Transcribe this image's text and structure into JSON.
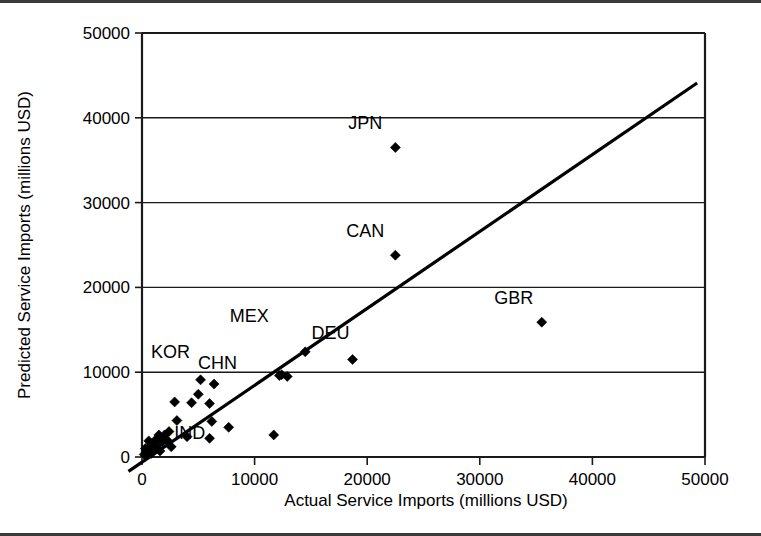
{
  "chart_data": {
    "type": "scatter",
    "title": "",
    "xlabel": "Actual Service Imports (millions USD)",
    "ylabel": "Predicted Service Imports (millions USD)",
    "xlim": [
      0,
      50000
    ],
    "ylim": [
      0,
      50000
    ],
    "xticks": [
      "0",
      "10000",
      "20000",
      "30000",
      "40000",
      "50000"
    ],
    "yticks": [
      "0",
      "10000",
      "20000",
      "30000",
      "40000",
      "50000"
    ],
    "xtick_values": [
      0,
      10000,
      20000,
      30000,
      40000,
      50000
    ],
    "ytick_values": [
      0,
      10000,
      20000,
      30000,
      40000,
      50000
    ],
    "grid": "horizontal",
    "legend": "none",
    "series": [
      {
        "name": "Countries",
        "marker": "diamond",
        "color": "#000000",
        "points": [
          {
            "label": "JPN",
            "x": 22500,
            "y": 36500,
            "label_dx": -30,
            "label_dy": -18
          },
          {
            "label": "CAN",
            "x": 22500,
            "y": 23800,
            "label_dx": -30,
            "label_dy": -18
          },
          {
            "label": "GBR",
            "x": 35500,
            "y": 15900,
            "label_dx": -28,
            "label_dy": -18
          },
          {
            "label": "MEX",
            "x": 14500,
            "y": 12400,
            "label_dx": -56,
            "label_dy": -30
          },
          {
            "label": "DEU",
            "x": 18700,
            "y": 11500,
            "label_dx": -22,
            "label_dy": -20
          },
          {
            "label": "CHN",
            "x": 12400,
            "y": 9700,
            "label_dx": -64,
            "label_dy": -6
          },
          {
            "label": "KOR",
            "x": 5200,
            "y": 9100,
            "label_dx": -30,
            "label_dy": -22
          },
          {
            "label": "IND",
            "x": 6200,
            "y": 4200,
            "label_dx": -22,
            "label_dy": 18
          },
          {
            "label": "",
            "x": 12200,
            "y": 9600,
            "label_dx": 0,
            "label_dy": 0
          },
          {
            "label": "",
            "x": 12900,
            "y": 9500,
            "label_dx": 0,
            "label_dy": 0
          },
          {
            "label": "",
            "x": 5000,
            "y": 7400,
            "label_dx": 0,
            "label_dy": 0
          },
          {
            "label": "",
            "x": 6400,
            "y": 8600,
            "label_dx": 0,
            "label_dy": 0
          },
          {
            "label": "",
            "x": 2900,
            "y": 6500,
            "label_dx": 0,
            "label_dy": 0
          },
          {
            "label": "",
            "x": 4400,
            "y": 6400,
            "label_dx": 0,
            "label_dy": 0
          },
          {
            "label": "",
            "x": 6000,
            "y": 6300,
            "label_dx": 0,
            "label_dy": 0
          },
          {
            "label": "",
            "x": 3100,
            "y": 4300,
            "label_dx": 0,
            "label_dy": 0
          },
          {
            "label": "",
            "x": 7700,
            "y": 3500,
            "label_dx": 0,
            "label_dy": 0
          },
          {
            "label": "",
            "x": 11700,
            "y": 2600,
            "label_dx": 0,
            "label_dy": 0
          },
          {
            "label": "",
            "x": 6000,
            "y": 2200,
            "label_dx": 0,
            "label_dy": 0
          },
          {
            "label": "",
            "x": 4000,
            "y": 2400,
            "label_dx": 0,
            "label_dy": 0
          },
          {
            "label": "",
            "x": 2400,
            "y": 3000,
            "label_dx": 0,
            "label_dy": 0
          },
          {
            "label": "",
            "x": 2000,
            "y": 2600,
            "label_dx": 0,
            "label_dy": 0
          },
          {
            "label": "",
            "x": 1500,
            "y": 2600,
            "label_dx": 0,
            "label_dy": 0
          },
          {
            "label": "",
            "x": 1200,
            "y": 2000,
            "label_dx": 0,
            "label_dy": 0
          },
          {
            "label": "",
            "x": 1800,
            "y": 1800,
            "label_dx": 0,
            "label_dy": 0
          },
          {
            "label": "",
            "x": 2300,
            "y": 1900,
            "label_dx": 0,
            "label_dy": 0
          },
          {
            "label": "",
            "x": 900,
            "y": 1500,
            "label_dx": 0,
            "label_dy": 0
          },
          {
            "label": "",
            "x": 1300,
            "y": 1300,
            "label_dx": 0,
            "label_dy": 0
          },
          {
            "label": "",
            "x": 700,
            "y": 1100,
            "label_dx": 0,
            "label_dy": 0
          },
          {
            "label": "",
            "x": 1000,
            "y": 900,
            "label_dx": 0,
            "label_dy": 0
          },
          {
            "label": "",
            "x": 500,
            "y": 800,
            "label_dx": 0,
            "label_dy": 0
          },
          {
            "label": "",
            "x": 400,
            "y": 500,
            "label_dx": 0,
            "label_dy": 0
          },
          {
            "label": "",
            "x": 800,
            "y": 400,
            "label_dx": 0,
            "label_dy": 0
          },
          {
            "label": "",
            "x": 200,
            "y": 300,
            "label_dx": 0,
            "label_dy": 0
          },
          {
            "label": "",
            "x": 1600,
            "y": 700,
            "label_dx": 0,
            "label_dy": 0
          },
          {
            "label": "",
            "x": 2600,
            "y": 1200,
            "label_dx": 0,
            "label_dy": 0
          },
          {
            "label": "",
            "x": 600,
            "y": 1900,
            "label_dx": 0,
            "label_dy": 0
          },
          {
            "label": "",
            "x": 300,
            "y": 1000,
            "label_dx": 0,
            "label_dy": 0
          }
        ]
      }
    ],
    "trendline": {
      "name": "fit-line",
      "x_start": -1200,
      "y_start": -1700,
      "x_end": 49300,
      "y_end": 44100
    }
  }
}
